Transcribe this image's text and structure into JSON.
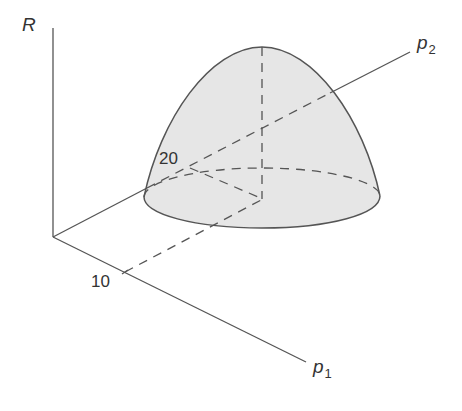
{
  "diagram": {
    "type": "3d-surface-sketch",
    "colors": {
      "line": "#555555",
      "fill": "#e6e6e6",
      "text": "#333333"
    },
    "axes": {
      "vertical": {
        "label": "R"
      },
      "p1": {
        "label": "p",
        "subscript": "1",
        "tick_label": "10"
      },
      "p2": {
        "label": "p",
        "subscript": "2",
        "tick_label": "20"
      }
    },
    "peak": {
      "p1": 10,
      "p2": 20
    }
  }
}
